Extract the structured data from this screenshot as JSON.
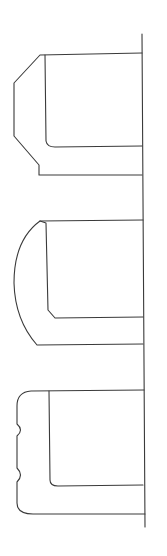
{
  "diagram": {
    "type": "profile-cross-sections",
    "stroke_color": "#3a3a3a",
    "background": "#ffffff",
    "labels": [],
    "baseline": {
      "x1": 142,
      "y1": 34,
      "x2": 145,
      "y2": 527
    },
    "profiles": [
      {
        "name": "chamfered-profile",
        "edge_style": "chamfered",
        "outer": "M142,53 L40,55 L14,83 L14,136 L39,165 L39,175 L142,175",
        "inner": "M45,55 L46,141 Q47,147 55,147 L142,146"
      },
      {
        "name": "curved-profile",
        "edge_style": "convex-arc",
        "outer": "M143,220 L40,221 Q14,240 14,283 Q15,320 37,345 L143,344",
        "inner": "M40,221 L46,223 L48,310 L55,318 L143,317"
      },
      {
        "name": "notched-profile",
        "edge_style": "rounded-with-notches",
        "outer": "M144,390 L31,391 Q17,392 17,406 L17,424 Q24,430 17,436 L17,468 Q24,475 17,482 L17,503 Q17,514 33,514 L145,514",
        "inner": "M49,391 L50,480 Q50,486 58,486 L143,485"
      }
    ]
  }
}
